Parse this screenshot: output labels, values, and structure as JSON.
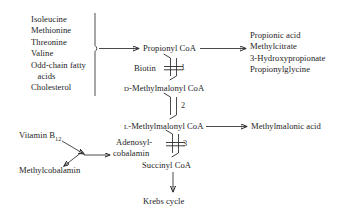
{
  "diagram": {
    "substrates": {
      "name": "substrate-list",
      "lines": [
        "Isoleucine",
        "Methionine",
        "Threonine",
        "Valine",
        "Odd-chain fatty",
        "   acids",
        "Cholesterol"
      ]
    },
    "products": {
      "name": "product-list",
      "lines": [
        "Propionic acid",
        "Methylcitrate",
        "3-Hydroxypropionate",
        "Propionylglycine"
      ]
    },
    "metabolites": {
      "propionyl_coa": "Propionyl CoA",
      "d_methylmalonyl_prefix": "D",
      "d_methylmalonyl_rest": "-Methylmalonyl CoA",
      "l_methylmalonyl_prefix": "L",
      "l_methylmalonyl_rest": "-Methylmalonyl CoA",
      "succinyl_coa": "Succinyl CoA",
      "krebs_cycle": "Krebs cycle",
      "methylmalonic_acid": "Methylmalonic acid"
    },
    "cofactors": {
      "biotin": "Biotin",
      "adenosyl_line1": "Adenosyl-",
      "adenosyl_line2": "cobalamin",
      "vitamin_b12_main": "Vitamin B",
      "vitamin_b12_sub": "12",
      "methylcobalamin": "Methylcobalamin"
    },
    "reaction_numbers": {
      "one": "1",
      "two": "2",
      "three": "3"
    },
    "colors": {
      "ink": "#2a2a2a",
      "background": "#ffffff"
    }
  }
}
